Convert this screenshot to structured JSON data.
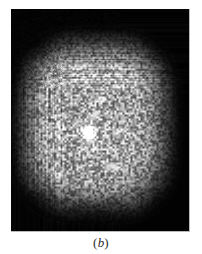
{
  "figure": {
    "caption_label": "(b)",
    "caption_prefix": "(",
    "caption_letter": "b",
    "caption_suffix": ")",
    "panel_background_color": "#000000",
    "page_background_color": "#ffffff",
    "border_color": "#b9b9b9",
    "panel": {
      "x": 11,
      "y": 9,
      "width": 179,
      "height": 223
    }
  },
  "chart_data": {
    "type": "heatmap",
    "title": "",
    "subtitle": "",
    "xlabel": "",
    "ylabel": "",
    "annotations": [
      "(b)"
    ],
    "legend": [],
    "legend_position": "none",
    "grid": false,
    "colormap": "grayscale",
    "colormap_stops": [
      "#000000",
      "#3a3a3a",
      "#7a7a7a",
      "#b8b8b8",
      "#e8e8e8",
      "#ffffff"
    ],
    "intensity_range": [
      0,
      255
    ],
    "xlim": [
      0,
      179
    ],
    "ylim": [
      0,
      223
    ],
    "noise": {
      "type": "speckle",
      "grain_px": 2,
      "amplitude": 0.45,
      "seed": 20240607
    },
    "cloud": {
      "shape": "rounded-square",
      "center_x": 84,
      "center_y": 116,
      "half_width": 68,
      "half_height": 78,
      "superellipse_exponent": 3.1,
      "edge_softness": 0.34,
      "peak_intensity": 0.78,
      "plateau_intensity": 0.66
    },
    "core": {
      "label": "bright central core",
      "center_x": 78,
      "center_y": 124,
      "radius_x": 4.2,
      "radius_y": 7.0,
      "peak_intensity": 1.0,
      "halo_radius_x": 16,
      "halo_radius_y": 20,
      "halo_intensity": 0.42
    },
    "dark_patches": [
      {
        "x": 18,
        "y": 28,
        "rx": 26,
        "ry": 22,
        "strength": 0.55
      },
      {
        "x": 150,
        "y": 34,
        "rx": 24,
        "ry": 20,
        "strength": 0.45
      },
      {
        "x": 24,
        "y": 196,
        "rx": 26,
        "ry": 20,
        "strength": 0.5
      },
      {
        "x": 152,
        "y": 196,
        "rx": 24,
        "ry": 20,
        "strength": 0.45
      },
      {
        "x": 84,
        "y": 206,
        "rx": 40,
        "ry": 16,
        "strength": 0.35
      },
      {
        "x": 62,
        "y": 100,
        "rx": 10,
        "ry": 4,
        "strength": 0.3
      }
    ]
  }
}
